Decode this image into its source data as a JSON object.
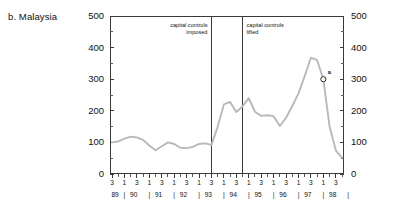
{
  "panel": {
    "title": "b. Malaysia"
  },
  "annotations": {
    "imposed": "capital controls\nimposed",
    "lifted": "capital controls\nlifted",
    "marker_label": "a"
  },
  "chart_data": {
    "type": "line",
    "title": "b. Malaysia",
    "xlabel": "",
    "ylabel": "",
    "ylim": [
      0,
      500
    ],
    "ytick_labels_left": [
      "500",
      "400",
      "300",
      "200",
      "100",
      "0"
    ],
    "ytick_labels_right": [
      "500",
      "400",
      "300",
      "200",
      "100",
      "0"
    ],
    "ytick_values": [
      500,
      400,
      300,
      200,
      100,
      0
    ],
    "yminor_values": [
      450,
      350,
      250,
      150,
      50
    ],
    "grid": false,
    "legend": "none",
    "axis_dual": true,
    "x_quarter_labels": [
      "3",
      "1",
      "3",
      "1",
      "3",
      "1",
      "3",
      "1",
      "3",
      "1",
      "3",
      "1",
      "3",
      "1",
      "3",
      "1",
      "3",
      "1",
      "3"
    ],
    "x_year_labels": [
      "89",
      "90",
      "91",
      "92",
      "93",
      "94",
      "95",
      "96",
      "97",
      "98"
    ],
    "x_year_separator": "|",
    "x": [
      "89Q3",
      "89Q4",
      "90Q1",
      "90Q2",
      "90Q3",
      "90Q4",
      "91Q1",
      "91Q2",
      "91Q3",
      "91Q4",
      "92Q1",
      "92Q2",
      "92Q3",
      "92Q4",
      "93Q1",
      "93Q2",
      "93Q3",
      "93Q4",
      "94Q1",
      "94Q2",
      "94Q3",
      "94Q4",
      "95Q1",
      "95Q2",
      "95Q3",
      "95Q4",
      "96Q1",
      "96Q2",
      "96Q3",
      "96Q4",
      "97Q1",
      "97Q2",
      "97Q3",
      "97Q4",
      "98Q1",
      "98Q2",
      "98Q3",
      "98Q4"
    ],
    "values": [
      100,
      103,
      112,
      118,
      116,
      108,
      90,
      75,
      88,
      100,
      95,
      83,
      82,
      86,
      95,
      97,
      92,
      150,
      220,
      228,
      196,
      214,
      240,
      197,
      184,
      186,
      183,
      152,
      178,
      215,
      255,
      310,
      368,
      360,
      300,
      150,
      75,
      52
    ],
    "annotations": [
      {
        "text": "capital controls imposed",
        "x": "93Q3",
        "type": "vline"
      },
      {
        "text": "capital controls lifted",
        "x": "94Q4",
        "type": "vline"
      },
      {
        "text": "a",
        "x": "98Q1",
        "y": 300,
        "type": "open-circle-marker"
      }
    ],
    "series_color": "#b9b9b9"
  }
}
